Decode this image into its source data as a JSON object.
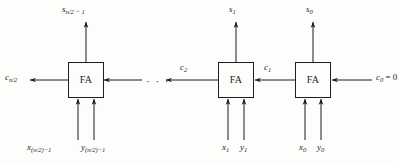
{
  "figure": {
    "background_color": "#fdfdfc",
    "ink_color": "#1d1d1d",
    "ellipsis": "· · ·",
    "blocks": [
      {
        "id": "fa-high",
        "label": "FA"
      },
      {
        "id": "fa-one",
        "label": "FA"
      },
      {
        "id": "fa-zero",
        "label": "FA"
      }
    ],
    "labels": {
      "sum_high": {
        "base": "s",
        "sub": "n/2 − 1"
      },
      "sum_one": {
        "base": "s",
        "sub": "1"
      },
      "sum_zero": {
        "base": "s",
        "sub": "0"
      },
      "carry_out": {
        "base": "c",
        "sub": "n/2"
      },
      "carry_two": {
        "base": "c",
        "sub": "2"
      },
      "carry_one": {
        "base": "c",
        "sub": "1"
      },
      "carry_in": {
        "base": "c",
        "sub": "0",
        "suffix": " = 0"
      },
      "x_high": {
        "base": "x",
        "sub": "(n/2)−1"
      },
      "y_high": {
        "base": "y",
        "sub": "(n/2)−1"
      },
      "x_one": {
        "base": "x",
        "sub": "1"
      },
      "y_one": {
        "base": "y",
        "sub": "1"
      },
      "x_zero": {
        "base": "x",
        "sub": "0"
      },
      "y_zero": {
        "base": "y",
        "sub": "0"
      }
    }
  }
}
